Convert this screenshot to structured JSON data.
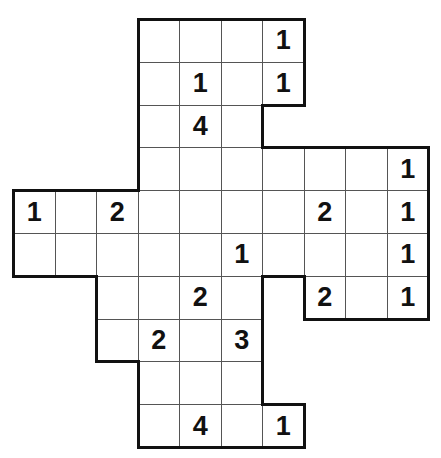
{
  "puzzle": {
    "type": "number-grid-puzzle",
    "grid_origin": {
      "x": 13,
      "y": 19
    },
    "cell_size": {
      "w": 41.5,
      "h": 42.8
    },
    "columns": 10,
    "rows": 10,
    "line_color": "#555555",
    "border_color": "#111111",
    "rows_data": [
      {
        "row": 0,
        "cols": [
          3,
          6
        ],
        "clues": {
          "6": "1"
        }
      },
      {
        "row": 1,
        "cols": [
          3,
          6
        ],
        "clues": {
          "4": "1",
          "6": "1"
        }
      },
      {
        "row": 2,
        "cols": [
          3,
          5
        ],
        "clues": {
          "4": "4"
        }
      },
      {
        "row": 3,
        "cols": [
          3,
          9
        ],
        "clues": {
          "9": "1"
        }
      },
      {
        "row": 4,
        "cols": [
          0,
          9
        ],
        "clues": {
          "0": "1",
          "2": "2",
          "7": "2",
          "9": "1"
        }
      },
      {
        "row": 5,
        "cols": [
          0,
          9
        ],
        "clues": {
          "5": "1",
          "9": "1"
        }
      },
      {
        "row": 6,
        "cols": [
          2,
          5
        ],
        "clues": {
          "4": "2"
        }
      },
      {
        "row": 6,
        "cols": [
          7,
          9
        ],
        "clues": {
          "7": "2",
          "9": "1"
        }
      },
      {
        "row": 7,
        "cols": [
          2,
          5
        ],
        "clues": {
          "3": "2",
          "5": "3"
        }
      },
      {
        "row": 8,
        "cols": [
          3,
          5
        ],
        "clues": {}
      },
      {
        "row": 9,
        "cols": [
          3,
          6
        ],
        "clues": {
          "4": "4",
          "6": "1"
        }
      }
    ]
  }
}
